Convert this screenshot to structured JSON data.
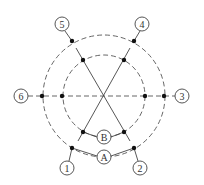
{
  "diagram": {
    "type": "pole-winding-schematic",
    "center": [
      104,
      96
    ],
    "rings": {
      "outer": {
        "id": "A",
        "radius": 61,
        "style": "dashed"
      },
      "inner": {
        "id": "B",
        "radius": 41,
        "style": "dashed"
      }
    },
    "terminals": [
      {
        "label": "1",
        "x": 67,
        "y": 168
      },
      {
        "label": "2",
        "x": 140,
        "y": 168
      },
      {
        "label": "3",
        "x": 182,
        "y": 96
      },
      {
        "label": "4",
        "x": 142,
        "y": 24
      },
      {
        "label": "5",
        "x": 62,
        "y": 24
      },
      {
        "label": "6",
        "x": 21,
        "y": 96
      }
    ],
    "ring_labels": [
      {
        "label": "A",
        "x": 104,
        "y": 157
      },
      {
        "label": "B",
        "x": 104,
        "y": 137
      }
    ],
    "colors": {
      "line": "#444444",
      "dot": "#111111",
      "background": "#ffffff"
    }
  }
}
